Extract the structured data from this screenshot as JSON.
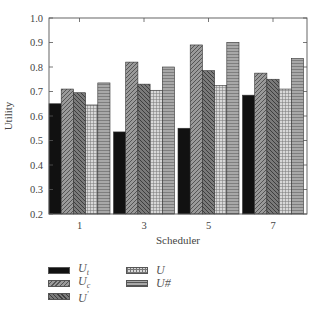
{
  "chart_data": {
    "type": "bar",
    "title": "",
    "xlabel": "Scheduler",
    "ylabel": "Utility",
    "ylim": [
      0.2,
      1.0
    ],
    "yticks": [
      "0.2",
      "0.3",
      "0.4",
      "0.5",
      "0.6",
      "0.7",
      "0.8",
      "0.9",
      "1.0"
    ],
    "grid": false,
    "legend_position": "below",
    "categories": [
      "1",
      "3",
      "5",
      "7"
    ],
    "series": [
      {
        "name": "U_t",
        "label_main": "U",
        "label_sub": "t",
        "label_sup": "",
        "pattern": "solid",
        "values": [
          0.65,
          0.535,
          0.55,
          0.685
        ]
      },
      {
        "name": "U_c",
        "label_main": "U",
        "label_sub": "c",
        "label_sup": "",
        "pattern": "diag-forward",
        "values": [
          0.71,
          0.82,
          0.89,
          0.775
        ]
      },
      {
        "name": "U'",
        "label_main": "U",
        "label_sub": "",
        "label_sup": "'",
        "pattern": "diag-back",
        "values": [
          0.695,
          0.73,
          0.785,
          0.75
        ]
      },
      {
        "name": "U",
        "label_main": "U",
        "label_sub": "",
        "label_sup": "",
        "pattern": "grid",
        "values": [
          0.645,
          0.705,
          0.725,
          0.71
        ]
      },
      {
        "name": "U#",
        "label_main": "U#",
        "label_sub": "",
        "label_sup": "",
        "pattern": "horizontal",
        "values": [
          0.735,
          0.8,
          0.9,
          0.835
        ]
      }
    ]
  }
}
